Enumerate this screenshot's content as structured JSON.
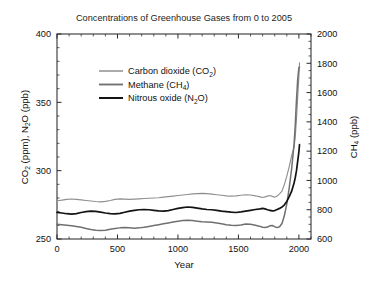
{
  "chart_data": {
    "type": "line",
    "title": "Concentrations of Greenhouse Gases from 0 to 2005",
    "xlabel": "Year",
    "ylabel_left": "CO2 (ppm), N2O (ppb)",
    "ylabel_right": "CH4 (ppb)",
    "xlim": [
      0,
      2100
    ],
    "ylim_left": [
      250,
      400
    ],
    "ylim_right": [
      600,
      2000
    ],
    "xticks": [
      0,
      500,
      1000,
      1500,
      2000
    ],
    "xticklabels": [
      "0",
      "500",
      "1000",
      "1500",
      "2000"
    ],
    "xminor_step": 100,
    "yticks_left": [
      250,
      300,
      350,
      400
    ],
    "yticklabels_left": [
      "250",
      "300",
      "350",
      "400"
    ],
    "yminor_step_left": 10,
    "yticks_right": [
      600,
      800,
      1000,
      1200,
      1400,
      1600,
      1800,
      2000
    ],
    "yticklabels_right": [
      "600",
      "800",
      "1000",
      "1200",
      "1400",
      "1600",
      "1800",
      "2000"
    ],
    "yminor_step_right": 50,
    "grid": false,
    "legend_position": "upper-left-inside",
    "series": [
      {
        "name": "Carbon dioxide (CO2)",
        "label_main": "Carbon dioxide (CO",
        "label_sub": "2",
        "label_tail": ")",
        "axis": "left",
        "unit": "ppm",
        "color": "#8f8f8f",
        "width": 1.15,
        "x": [
          0,
          40,
          80,
          120,
          160,
          200,
          240,
          280,
          320,
          360,
          400,
          440,
          480,
          520,
          560,
          600,
          640,
          680,
          720,
          760,
          800,
          840,
          880,
          920,
          960,
          1000,
          1040,
          1080,
          1120,
          1160,
          1200,
          1240,
          1280,
          1320,
          1360,
          1400,
          1440,
          1480,
          1520,
          1560,
          1600,
          1640,
          1680,
          1700,
          1720,
          1740,
          1760,
          1780,
          1800,
          1820,
          1840,
          1860,
          1880,
          1900,
          1920,
          1940,
          1960,
          1970,
          1980,
          1990,
          2000,
          2005
        ],
        "y": [
          278,
          278.4,
          279,
          279.3,
          279,
          278.6,
          278.2,
          277.8,
          277.4,
          277.2,
          277.5,
          278.2,
          279,
          279.4,
          279.2,
          279,
          279.2,
          279.4,
          279.6,
          279.8,
          280,
          280.2,
          280.6,
          281,
          281.4,
          281.8,
          282.2,
          282.6,
          283,
          283.2,
          283.4,
          283.2,
          282.8,
          282.4,
          282,
          281.6,
          281.4,
          281.6,
          282,
          282.4,
          282.2,
          281.6,
          280.8,
          280.4,
          280.8,
          281.4,
          281.8,
          281.2,
          280.6,
          281.4,
          283,
          285,
          290,
          296,
          303,
          311,
          317,
          325,
          338,
          354,
          369,
          379
        ]
      },
      {
        "name": "Methane (CH4)",
        "label_main": "Methane (CH",
        "label_sub": "4",
        "label_tail": ")",
        "axis": "right",
        "unit": "ppb",
        "color": "#707070",
        "width": 1.5,
        "x": [
          0,
          40,
          80,
          120,
          160,
          200,
          240,
          280,
          320,
          360,
          400,
          440,
          480,
          520,
          560,
          600,
          640,
          680,
          720,
          760,
          800,
          840,
          880,
          920,
          960,
          1000,
          1040,
          1080,
          1120,
          1160,
          1200,
          1240,
          1280,
          1320,
          1360,
          1400,
          1440,
          1480,
          1520,
          1560,
          1600,
          1640,
          1680,
          1700,
          1720,
          1740,
          1760,
          1780,
          1800,
          1820,
          1840,
          1860,
          1880,
          1900,
          1920,
          1940,
          1960,
          1970,
          1980,
          1990,
          2000,
          2005
        ],
        "y": [
          700,
          698,
          694,
          690,
          686,
          680,
          672,
          665,
          660,
          658,
          660,
          666,
          672,
          676,
          678,
          676,
          674,
          676,
          680,
          686,
          692,
          698,
          704,
          710,
          716,
          722,
          726,
          728,
          726,
          722,
          718,
          716,
          714,
          710,
          704,
          698,
          694,
          692,
          696,
          702,
          700,
          694,
          686,
          680,
          678,
          682,
          690,
          692,
          684,
          678,
          684,
          706,
          760,
          840,
          950,
          1080,
          1250,
          1380,
          1550,
          1690,
          1770,
          1774
        ]
      },
      {
        "name": "Nitrous oxide (N2O)",
        "label_main": "Nitrous oxide (N",
        "label_sub": "2",
        "label_tail": "O)",
        "axis": "left",
        "unit": "ppb",
        "color": "#131313",
        "width": 1.7,
        "x": [
          0,
          40,
          80,
          120,
          160,
          200,
          240,
          280,
          320,
          360,
          400,
          440,
          480,
          520,
          560,
          600,
          640,
          680,
          720,
          760,
          800,
          840,
          880,
          920,
          960,
          1000,
          1040,
          1080,
          1120,
          1160,
          1200,
          1240,
          1280,
          1320,
          1360,
          1400,
          1440,
          1480,
          1520,
          1560,
          1600,
          1640,
          1680,
          1700,
          1720,
          1740,
          1760,
          1780,
          1800,
          1820,
          1840,
          1860,
          1880,
          1900,
          1920,
          1940,
          1960,
          1970,
          1980,
          1990,
          2000,
          2005
        ],
        "y": [
          269.5,
          269,
          268.5,
          268.2,
          268.6,
          269.4,
          270,
          270.4,
          270.2,
          269.6,
          269,
          268.6,
          268.4,
          268.8,
          269.6,
          270.4,
          271,
          271.4,
          271.6,
          271.4,
          271,
          270.6,
          270.4,
          270.8,
          271.6,
          272.4,
          273,
          273.4,
          273.2,
          272.6,
          272,
          271.6,
          271.4,
          271,
          270.4,
          270,
          269.6,
          269.4,
          269.8,
          270.4,
          271,
          271.6,
          272,
          272.4,
          272,
          271.4,
          271,
          270.6,
          270.8,
          271.6,
          272.4,
          273.4,
          275,
          277.5,
          281,
          285,
          291,
          295,
          300,
          307,
          314,
          319
        ]
      }
    ]
  }
}
